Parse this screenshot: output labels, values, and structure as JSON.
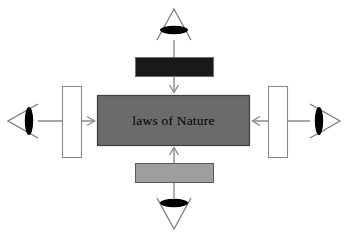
{
  "diagram": {
    "type": "concept-diagram",
    "background_color": "#ffffff",
    "center": {
      "label": "laws of Nature",
      "fill_color": "#6b6b6b",
      "border_color": "#3d3d3d",
      "text_color": "#000000"
    },
    "bars": [
      {
        "id": "top-bar",
        "position": "top",
        "label": "",
        "fill_color": "#1a1a1a",
        "border_color": "#6e6e6e",
        "orientation": "horizontal"
      },
      {
        "id": "bottom-bar",
        "position": "bottom",
        "label": "",
        "fill_color": "#9e9e9e",
        "border_color": "#5a5a5a",
        "orientation": "horizontal"
      },
      {
        "id": "left-bar",
        "position": "left",
        "label": "",
        "fill_color": "#ffffff",
        "border_color": "#8a8a8a",
        "orientation": "vertical"
      },
      {
        "id": "right-bar",
        "position": "right",
        "label": "",
        "fill_color": "#ffffff",
        "border_color": "#8a8a8a",
        "orientation": "vertical"
      }
    ],
    "observers": [
      {
        "id": "observer-top",
        "position": "top",
        "points": "down",
        "label": "",
        "eye_color": "#000000",
        "triangle_color": "#7a7a7a"
      },
      {
        "id": "observer-bottom",
        "position": "bottom",
        "points": "up",
        "label": "",
        "eye_color": "#000000",
        "triangle_color": "#7a7a7a"
      },
      {
        "id": "observer-left",
        "position": "left",
        "points": "right",
        "label": "",
        "eye_color": "#000000",
        "triangle_color": "#7a7a7a"
      },
      {
        "id": "observer-right",
        "position": "right",
        "points": "left",
        "label": "",
        "eye_color": "#000000",
        "triangle_color": "#7a7a7a"
      }
    ],
    "arrows": [
      {
        "id": "arrow-top",
        "from": "observer-top",
        "to": "center",
        "direction": "down",
        "color": "#8a8a8a"
      },
      {
        "id": "arrow-bottom",
        "from": "observer-bottom",
        "to": "center",
        "direction": "up",
        "color": "#8a8a8a"
      },
      {
        "id": "arrow-left",
        "from": "observer-left",
        "to": "center",
        "direction": "right",
        "color": "#8a8a8a"
      },
      {
        "id": "arrow-right",
        "from": "observer-right",
        "to": "center",
        "direction": "left",
        "color": "#8a8a8a"
      }
    ]
  }
}
